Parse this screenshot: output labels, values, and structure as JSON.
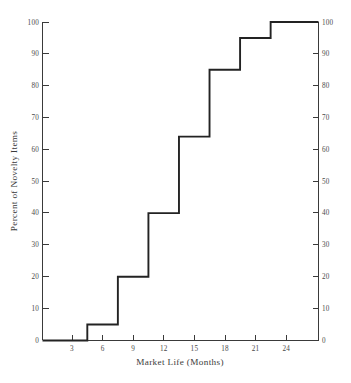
{
  "chart_data": {
    "type": "line",
    "subtype": "cumulative-step-ogive",
    "title": "",
    "xlabel": "Market Life (Months)",
    "ylabel": "Percent of Novelty Items",
    "xlim": [
      0.1,
      27.2
    ],
    "ylim": [
      0,
      100
    ],
    "grid": false,
    "legend": null,
    "x_ticks": [
      3,
      6,
      9,
      12,
      15,
      18,
      21,
      24
    ],
    "x_tick_labels": [
      "3",
      "6",
      "9",
      "12",
      "15",
      "18",
      "21",
      "24"
    ],
    "y_ticks": [
      0,
      10,
      20,
      30,
      40,
      50,
      60,
      70,
      80,
      90,
      100
    ],
    "y_tick_labels": [
      "0",
      "10",
      "20",
      "30",
      "40",
      "50",
      "60",
      "70",
      "80",
      "90",
      "100"
    ],
    "right_axis_ticks": [
      0,
      10,
      20,
      30,
      40,
      50,
      60,
      70,
      80,
      90,
      100
    ],
    "right_axis_tick_labels": [
      "0",
      "10",
      "20",
      "30",
      "40",
      "50",
      "60",
      "70",
      "80",
      "90",
      "100"
    ],
    "step_edges": [
      4.5,
      7.5,
      10.5,
      13.5,
      16.5,
      19.5,
      22.5
    ],
    "cumulative_percent": [
      5,
      20,
      40,
      64,
      85,
      95,
      100
    ],
    "x": [
      0.1,
      4.5,
      4.5,
      7.5,
      7.5,
      10.5,
      10.5,
      13.5,
      13.5,
      16.5,
      16.5,
      19.5,
      19.5,
      22.5,
      22.5,
      27.2
    ],
    "values": [
      0,
      0,
      5,
      5,
      20,
      20,
      40,
      40,
      64,
      64,
      85,
      85,
      95,
      95,
      100,
      100
    ],
    "series": [
      {
        "name": "Percent of Novelty Items",
        "x": [
          0.1,
          4.5,
          4.5,
          7.5,
          7.5,
          10.5,
          10.5,
          13.5,
          13.5,
          16.5,
          16.5,
          19.5,
          19.5,
          22.5,
          22.5,
          27.2
        ],
        "values": [
          0,
          0,
          5,
          5,
          20,
          20,
          40,
          40,
          64,
          64,
          85,
          85,
          95,
          95,
          100,
          100
        ]
      }
    ],
    "line_color": "#232323",
    "axis_color": "#3a3a3a",
    "background_color": "#ffffff"
  },
  "axes": {
    "x_title": "Market Life (Months)",
    "y_title": "Percent of Novelty Items"
  }
}
